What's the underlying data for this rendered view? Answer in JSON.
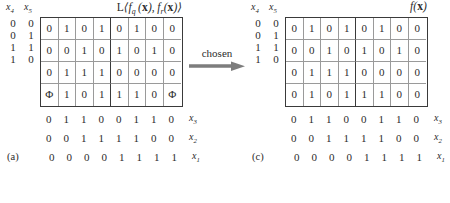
{
  "figure": {
    "transition_label": "chosen"
  },
  "panel_a": {
    "caption": "(a)",
    "col_header_x4": "x4",
    "col_header_x5": "x5",
    "function_label": "L⟨fq(x), fr(x)⟩",
    "row_labels": [
      [
        "0",
        "0"
      ],
      [
        "0",
        "1"
      ],
      [
        "1",
        "1"
      ],
      [
        "1",
        "0"
      ]
    ],
    "rows": [
      [
        "0",
        "1",
        "0",
        "1",
        "0",
        "1",
        "0",
        "0"
      ],
      [
        "0",
        "0",
        "1",
        "0",
        "1",
        "0",
        "1",
        "0"
      ],
      [
        "0",
        "1",
        "1",
        "1",
        "0",
        "0",
        "0",
        "0"
      ],
      [
        "Φ",
        "1",
        "0",
        "1",
        "1",
        "1",
        "0",
        "Φ"
      ]
    ],
    "axis": [
      {
        "name": "x3",
        "values": [
          "0",
          "1",
          "1",
          "0",
          "0",
          "1",
          "1",
          "0"
        ]
      },
      {
        "name": "x2",
        "values": [
          "0",
          "0",
          "1",
          "1",
          "1",
          "1",
          "0",
          "0"
        ]
      },
      {
        "name": "x1",
        "values": [
          "0",
          "0",
          "0",
          "0",
          "1",
          "1",
          "1",
          "1"
        ]
      }
    ]
  },
  "panel_c": {
    "caption": "(c)",
    "col_header_x4": "x4",
    "col_header_x5": "x5",
    "function_label": "f(x)",
    "row_labels": [
      [
        "0",
        "0"
      ],
      [
        "0",
        "1"
      ],
      [
        "1",
        "1"
      ],
      [
        "1",
        "0"
      ]
    ],
    "rows": [
      [
        "0",
        "1",
        "0",
        "1",
        "0",
        "1",
        "0",
        "0"
      ],
      [
        "0",
        "0",
        "1",
        "0",
        "1",
        "0",
        "1",
        "0"
      ],
      [
        "0",
        "1",
        "1",
        "1",
        "0",
        "0",
        "0",
        "0"
      ],
      [
        "0",
        "1",
        "0",
        "1",
        "1",
        "1",
        "0",
        "0"
      ]
    ],
    "axis": [
      {
        "name": "x3",
        "values": [
          "0",
          "1",
          "1",
          "0",
          "0",
          "1",
          "1",
          "0"
        ]
      },
      {
        "name": "x2",
        "values": [
          "0",
          "0",
          "1",
          "1",
          "1",
          "1",
          "0",
          "0"
        ]
      },
      {
        "name": "x1",
        "values": [
          "0",
          "0",
          "0",
          "0",
          "1",
          "1",
          "1",
          "1"
        ]
      }
    ]
  },
  "colors": {
    "border": "#3a3a3a",
    "grid_line": "#9a9a9a",
    "text": "#2b2b2b",
    "background": "#ffffff"
  }
}
